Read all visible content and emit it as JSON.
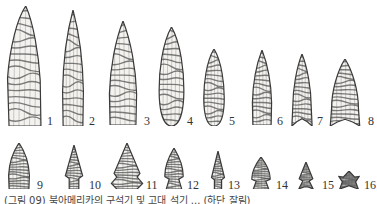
{
  "figure": {
    "points": [
      {
        "label": "1",
        "x": 6,
        "y": 6,
        "w": 38,
        "h": 120,
        "shape": "lanceolate-fluted"
      },
      {
        "label": "2",
        "x": 60,
        "y": 10,
        "w": 26,
        "h": 116,
        "shape": "lanceolate"
      },
      {
        "label": "3",
        "x": 106,
        "y": 21,
        "w": 34,
        "h": 104,
        "shape": "lanceolate"
      },
      {
        "label": "4",
        "x": 157,
        "y": 27,
        "w": 29,
        "h": 99,
        "shape": "leaf"
      },
      {
        "label": "5",
        "x": 202,
        "y": 49,
        "w": 24,
        "h": 77,
        "shape": "leaf"
      },
      {
        "label": "6",
        "x": 250,
        "y": 50,
        "w": 24,
        "h": 75,
        "shape": "lanceolate"
      },
      {
        "label": "7",
        "x": 291,
        "y": 54,
        "w": 22,
        "h": 72,
        "shape": "fluted-concave-base"
      },
      {
        "label": "8",
        "x": 329,
        "y": 59,
        "w": 32,
        "h": 67,
        "shape": "fluted-concave-base"
      },
      {
        "label": "9",
        "x": 6,
        "y": 143,
        "w": 26,
        "h": 46,
        "shape": "lanceolate"
      },
      {
        "label": "10",
        "x": 62,
        "y": 145,
        "w": 24,
        "h": 44,
        "shape": "stemmed"
      },
      {
        "label": "11",
        "x": 110,
        "y": 143,
        "w": 34,
        "h": 46,
        "shape": "side-notched"
      },
      {
        "label": "12",
        "x": 162,
        "y": 148,
        "w": 24,
        "h": 41,
        "shape": "corner-notched"
      },
      {
        "label": "13",
        "x": 209,
        "y": 151,
        "w": 18,
        "h": 38,
        "shape": "stemmed"
      },
      {
        "label": "14",
        "x": 249,
        "y": 157,
        "w": 24,
        "h": 32,
        "shape": "corner-notched"
      },
      {
        "label": "15",
        "x": 296,
        "y": 162,
        "w": 20,
        "h": 27,
        "shape": "corner-notched-small"
      },
      {
        "label": "16",
        "x": 338,
        "y": 171,
        "w": 22,
        "h": 18,
        "shape": "tiny-notched"
      }
    ],
    "label_positions": [
      {
        "label": "1",
        "x": 47,
        "y": 115
      },
      {
        "label": "2",
        "x": 89,
        "y": 115
      },
      {
        "label": "3",
        "x": 144,
        "y": 115
      },
      {
        "label": "4",
        "x": 187,
        "y": 115
      },
      {
        "label": "5",
        "x": 229,
        "y": 115
      },
      {
        "label": "6",
        "x": 277,
        "y": 115
      },
      {
        "label": "7",
        "x": 317,
        "y": 115
      },
      {
        "label": "8",
        "x": 368,
        "y": 115
      },
      {
        "label": "9",
        "x": 37,
        "y": 179
      },
      {
        "label": "10",
        "x": 89,
        "y": 179
      },
      {
        "label": "11",
        "x": 146,
        "y": 179
      },
      {
        "label": "12",
        "x": 187,
        "y": 179
      },
      {
        "label": "13",
        "x": 228,
        "y": 179
      },
      {
        "label": "14",
        "x": 276,
        "y": 179
      },
      {
        "label": "15",
        "x": 322,
        "y": 179
      },
      {
        "label": "16",
        "x": 364,
        "y": 179
      }
    ],
    "caption": "(그림 09) 북아메리카의 구석기 및 고대 석기 ... (하단 잘림)"
  },
  "colors": {
    "ink": "#3a3a3a",
    "stone_fill": "#f4f2ee",
    "hatch": "#555555",
    "background": "#ffffff"
  }
}
